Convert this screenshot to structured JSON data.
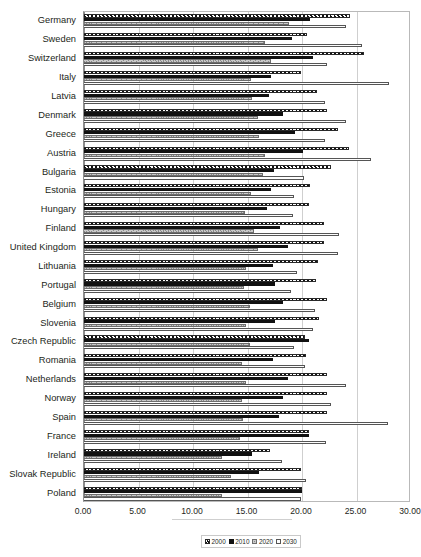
{
  "chart": {
    "title": "",
    "x_axis": {
      "label": "",
      "min": 0,
      "max": 30,
      "tick_step": 5,
      "ticks": [
        "0.00",
        "5.00",
        "10.00",
        "15.00",
        "20.00",
        "25.00",
        "30.00"
      ]
    },
    "legend": {
      "position": "bottom",
      "items": [
        {
          "label": "2000",
          "key": "s2000",
          "pattern": "diagonal-hatch"
        },
        {
          "label": "2010",
          "key": "s2010",
          "pattern": "solid-black"
        },
        {
          "label": "2020",
          "key": "s2020",
          "pattern": "grey-texture"
        },
        {
          "label": "2030",
          "key": "s2030",
          "pattern": "white-outline"
        }
      ]
    }
  },
  "chart_data": {
    "type": "bar",
    "orientation": "horizontal",
    "title": "",
    "xlabel": "",
    "ylabel": "",
    "xlim": [
      0,
      30
    ],
    "grid": true,
    "legend_position": "bottom",
    "categories": [
      "Germany",
      "Sweden",
      "Switzerland",
      "Italy",
      "Latvia",
      "Denmark",
      "Greece",
      "Austria",
      "Bulgaria",
      "Estonia",
      "Hungary",
      "Finland",
      "United Kingdom",
      "Lithuania",
      "Portugal",
      "Belgium",
      "Slovenia",
      "Czech Republic",
      "Romania",
      "Netherlands",
      "Norway",
      "Spain",
      "France",
      "Ireland",
      "Slovak Republic",
      "Poland"
    ],
    "series": [
      {
        "name": "2000",
        "values": [
          24.4,
          20.5,
          25.7,
          19.9,
          21.4,
          22.3,
          23.3,
          24.3,
          22.7,
          20.7,
          20.6,
          22.0,
          22.0,
          21.5,
          21.3,
          22.3,
          21.6,
          20.3,
          20.4,
          22.3,
          22.3,
          22.3,
          20.6,
          17.1,
          19.9,
          20.0
        ]
      },
      {
        "name": "2010",
        "values": [
          20.7,
          19.1,
          21.0,
          17.2,
          17.0,
          18.3,
          19.4,
          20.1,
          17.4,
          17.2,
          16.8,
          18.0,
          18.7,
          17.3,
          17.5,
          18.3,
          17.5,
          20.6,
          17.3,
          18.7,
          18.3,
          17.9,
          20.6,
          15.4,
          16.1,
          20.0
        ]
      },
      {
        "name": "2020",
        "values": [
          18.8,
          16.6,
          17.2,
          15.3,
          15.4,
          16.0,
          16.1,
          16.6,
          16.4,
          15.3,
          14.8,
          15.6,
          16.0,
          14.9,
          14.7,
          15.2,
          14.9,
          15.2,
          14.5,
          14.9,
          14.5,
          14.6,
          14.3,
          12.7,
          13.5,
          12.7
        ]
      },
      {
        "name": "2030",
        "values": [
          24.0,
          25.5,
          22.3,
          28.0,
          22.1,
          24.0,
          22.1,
          26.3,
          20.2,
          19.3,
          19.2,
          23.4,
          23.3,
          19.5,
          19.0,
          21.2,
          21.0,
          19.3,
          20.3,
          24.0,
          22.7,
          27.9,
          22.2,
          18.2,
          20.4,
          19.9
        ]
      }
    ]
  }
}
